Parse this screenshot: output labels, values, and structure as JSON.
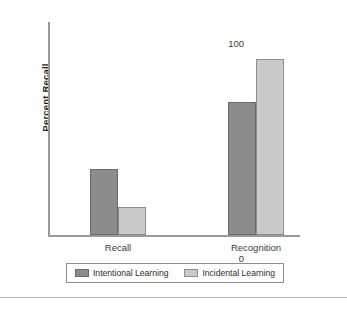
{
  "chart_data": {
    "type": "bar",
    "title": "",
    "subtitle": "",
    "xlabel": "",
    "ylabel": "Percent Recall",
    "ylim": [
      0,
      100
    ],
    "yticks": [
      0,
      50,
      100
    ],
    "ytick_labels": [
      "0",
      "50",
      "100"
    ],
    "grid": false,
    "legend_position": "bottom",
    "categories": [
      "Recall",
      "Recognition"
    ],
    "series": [
      {
        "name": "Intentional Learning",
        "color": "#8c8c8c",
        "values": [
          31,
          62
        ]
      },
      {
        "name": "Incidental Learning",
        "color": "#c9c9c9",
        "values": [
          13,
          82
        ]
      }
    ]
  },
  "axis": {
    "y_title": "Percent Recall",
    "y_tick_top": "100",
    "y_tick_mid": "50",
    "y_tick_zero": "0",
    "x_cat_1": "Recall",
    "x_cat_2": "Recognition"
  },
  "legend": {
    "entries": [
      {
        "label": "Intentional Learning",
        "swatch": "dark-gray-swatch"
      },
      {
        "label": "Incidental Learning",
        "swatch": "light-gray-swatch"
      }
    ]
  },
  "colors": {
    "intentional": "#8c8c8c",
    "incidental": "#c9c9c9",
    "axis": "#9a9a9a",
    "text": "#231f20",
    "background": "#ffffff"
  }
}
